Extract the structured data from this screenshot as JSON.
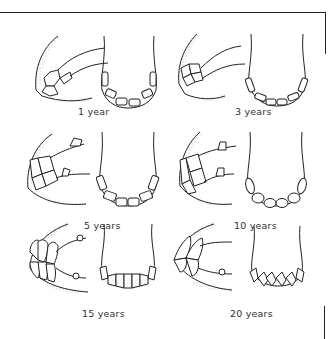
{
  "panels": [
    {
      "age": "1 year",
      "view": "side and front incisors"
    },
    {
      "age": "3 years",
      "view": "side and front incisors"
    },
    {
      "age": "5 years",
      "view": "side and front incisors"
    },
    {
      "age": "10 years",
      "view": "side and front incisors"
    },
    {
      "age": "15 years",
      "view": "side and front incisors"
    },
    {
      "age": "20 years",
      "view": "side and front incisors"
    }
  ],
  "colors": {
    "line": "#222222",
    "stipple": "#555555",
    "background": "#ffffff"
  }
}
